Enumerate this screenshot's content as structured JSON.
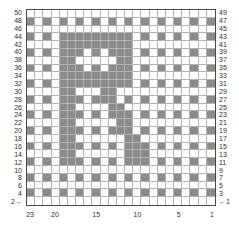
{
  "chart_data": {
    "type": "heatmap",
    "columns": 23,
    "rows_displayed": 25,
    "knitting_rows_total": 50,
    "fill_color": "#8b8b8b",
    "empty_color": "#ffffff",
    "grid_line_color": "#b2b2b2",
    "border_color": "#4a4a4a",
    "rows": [
      ".......................",
      "#.#.#.#.#.#.#.#.#.#.#.#",
      ".......................",
      "#.#.#########.#.#.#.#.#",
      "....#########..........",
      "#.#.###.#.###.#.#.#.#.#",
      "....##.....##..........",
      "#.#.###.#.###.#.#.#.#.#",
      "....#########..........",
      "#.#.#########.#.#.#.#.#",
      "....##...##............",
      "#.#.###.###.#.#.#.#.#.#",
      "....##....##...........",
      "#.#.###.#.###.#.#.#.#.#",
      "....##.....##..........",
      "#.#.###.#.###.#.#.#.#.#",
      "....##......##.........",
      "#.#.###.#.#.###.#.#.#.#",
      "....##......###........",
      "#.#.###.#.#.###.#.#.#.#",
      ".......................",
      "#.#.#.#.#.#.#.#.#.#.#.#",
      ".......................",
      "#.#.#.#.#.#.#.#.#.#.#.#",
      "......................."
    ],
    "left_row_labels": [
      "50",
      "48",
      "46",
      "44",
      "42",
      "40",
      "38",
      "36",
      "34",
      "32",
      "30",
      "28",
      "26",
      "24",
      "22",
      "20",
      "18",
      "16",
      "14",
      "12",
      "10",
      "8",
      "6",
      "4",
      "2→"
    ],
    "right_row_labels": [
      "49",
      "47",
      "45",
      "43",
      "41",
      "39",
      "37",
      "35",
      "33",
      "31",
      "29",
      "27",
      "25",
      "23",
      "21",
      "19",
      "17",
      "15",
      "13",
      "11",
      "9",
      "7",
      "5",
      "3",
      "←1"
    ],
    "bottom_axis": {
      "labels": [
        "23",
        "20",
        "15",
        "10",
        "5",
        "1"
      ],
      "column_index": [
        1,
        4,
        9,
        14,
        19,
        23
      ]
    },
    "legend_position": "none",
    "grid": true
  },
  "colors": {
    "text": "#2f2f2f",
    "background": "#ffffff"
  }
}
